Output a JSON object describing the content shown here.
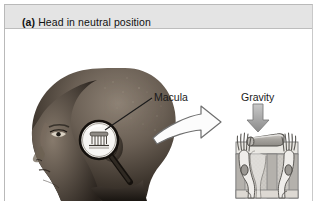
{
  "figure": {
    "panel_tag": "(a)",
    "title": "Head in neutral position",
    "background_color": "#ffffff",
    "title_bar_color": "#e4e4e4",
    "border_color": "#b9b9b9"
  },
  "labels": {
    "macula": "Macula",
    "gravity": "Gravity"
  },
  "icons": {
    "magnifier": "magnifier-icon",
    "transition_arrow": "block-arrow-right-icon",
    "gravity_arrow": "block-arrow-down-icon",
    "head_photo": "head-profile-photo",
    "leader_line": "leader-line"
  },
  "diagram": {
    "name": "macula-cross-section",
    "parts": [
      "otolithic-membrane",
      "gelatinous-layer",
      "hair-cell-left",
      "hair-cell-right",
      "stereocilia-bundle",
      "hair-cell-nucleus",
      "supporting-tissue",
      "nerve-fiber"
    ],
    "colors": {
      "tissue_light": "#e8e6e1",
      "tissue_mid": "#c8c6c1",
      "tissue_dark": "#b3b1ac",
      "cell_fill": "#efedea",
      "outline": "#555555",
      "membrane": "#b0aeaa",
      "arrow_gray": "#9a9a9a"
    }
  }
}
